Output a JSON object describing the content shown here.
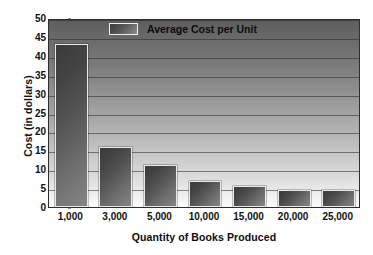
{
  "chart_data": {
    "type": "bar",
    "title": "",
    "categories": [
      "1,000",
      "3,000",
      "5,000",
      "10,000",
      "15,000",
      "20,000",
      "25,000"
    ],
    "values": [
      43,
      16,
      11,
      7,
      5.5,
      4.5,
      4.5
    ],
    "series": [
      {
        "name": "Average Cost per Unit",
        "values": [
          43,
          16,
          11,
          7,
          5.5,
          4.5,
          4.5
        ]
      }
    ],
    "xlabel": "Quantity of Books Produced",
    "ylabel": "Cost (in dollars)",
    "ylim": [
      0,
      50
    ],
    "ytick_labels": [
      "0",
      "5",
      "10",
      "15",
      "20",
      "25",
      "30",
      "35",
      "40",
      "45",
      "50"
    ],
    "ytick_values": [
      0,
      5,
      10,
      15,
      20,
      25,
      30,
      35,
      40,
      45,
      50
    ],
    "grid": true,
    "legend_position": "top-left-inside",
    "legend": [
      "Average Cost per Unit"
    ],
    "colors": {
      "bar_dark": "#3a3a3a",
      "bar_light": "#848484",
      "bar_border": "#e9e9e9",
      "plot_top": "#5d5d5d",
      "plot_bottom": "#fbfbfb",
      "axis": "#2e2e2e",
      "text": "#111111"
    }
  }
}
